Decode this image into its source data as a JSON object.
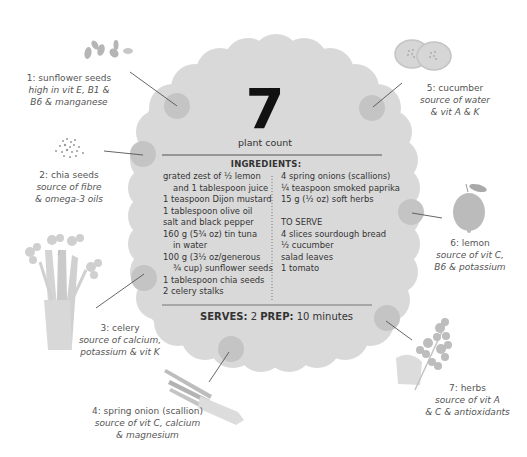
{
  "header": {
    "plant_count": "7",
    "plant_count_label": "plant count"
  },
  "ingredients": {
    "title": "INGREDIENTS:",
    "left_column": [
      {
        "text": "grated zest of ½ lemon",
        "indent": false
      },
      {
        "text": "and 1 tablespoon juice",
        "indent": true
      },
      {
        "text": "1 teaspoon Dijon mustard",
        "indent": false
      },
      {
        "text": "1 tablespoon olive oil",
        "indent": false
      },
      {
        "text": "salt and black pepper",
        "indent": false
      },
      {
        "text": "160 g (5¾ oz) tin tuna",
        "indent": false
      },
      {
        "text": "in water",
        "indent": true
      },
      {
        "text": "100 g (3½ oz/generous",
        "indent": false
      },
      {
        "text": "¾ cup) sunflower seeds",
        "indent": true
      },
      {
        "text": "1 tablespoon chia seeds",
        "indent": false
      },
      {
        "text": "2 celery stalks",
        "indent": false
      }
    ],
    "right_column": [
      {
        "text": "4 spring onions (scallions)"
      },
      {
        "text": "¼ teaspoon smoked paprika"
      },
      {
        "text": "15 g (½ oz) soft herbs"
      },
      {
        "text": ""
      },
      {
        "text": "TO SERVE"
      },
      {
        "text": "4 slices sourdough bread"
      },
      {
        "text": "½ cucumber"
      },
      {
        "text": "salad leaves"
      },
      {
        "text": "1 tomato"
      }
    ]
  },
  "footer": {
    "serves_label": "SERVES:",
    "serves_value": "2",
    "prep_label": "PREP:",
    "prep_value": "10 minutes"
  },
  "plants": [
    {
      "number": "1",
      "name": "1: sunflower seeds",
      "benefit_lines": [
        "high in vit E, B1 &",
        "B6 & manganese"
      ],
      "icon": "sunflower-seeds-icon"
    },
    {
      "number": "2",
      "name": "2: chia seeds",
      "benefit_lines": [
        "source of fibre",
        "& omega-3 oils"
      ],
      "icon": "chia-seeds-icon"
    },
    {
      "number": "3",
      "name": "3: celery",
      "benefit_lines": [
        "source of calcium,",
        "potassium & vit K"
      ],
      "icon": "celery-icon"
    },
    {
      "number": "4",
      "name": "4: spring onion (scallion)",
      "benefit_lines": [
        "source of vit C, calcium",
        "& magnesium"
      ],
      "icon": "spring-onion-icon"
    },
    {
      "number": "5",
      "name": "5: cucumber",
      "benefit_lines": [
        "source of water",
        "& vit A & K"
      ],
      "icon": "cucumber-icon"
    },
    {
      "number": "6",
      "name": "6: lemon",
      "benefit_lines": [
        "source of vit C,",
        "B6 & potassium"
      ],
      "icon": "lemon-icon"
    },
    {
      "number": "7",
      "name": "7: herbs",
      "benefit_lines": [
        "source of vit A",
        "& C & antioxidants"
      ],
      "icon": "herbs-icon"
    }
  ],
  "colors": {
    "blob": "#d9d9d9",
    "marker": "#c4c4c4",
    "rule": "#555555",
    "text": "#333333",
    "label_text": "#555555"
  }
}
